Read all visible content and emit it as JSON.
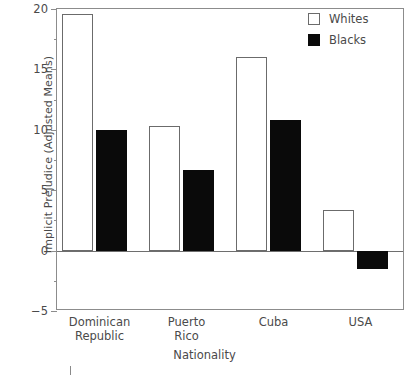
{
  "chart_data": {
    "type": "bar",
    "title": "",
    "subtitle": "",
    "xlabel": "Nationality",
    "ylabel": "Implicit Prejudice (Adjusted Means)",
    "categories": [
      "Dominican Republic",
      "Puerto Rico",
      "Cuba",
      "USA"
    ],
    "category_lines": [
      [
        "Dominican",
        "Republic"
      ],
      [
        "Puerto",
        "Rico"
      ],
      [
        "Cuba"
      ],
      [
        "USA"
      ]
    ],
    "series": [
      {
        "name": "Whites",
        "color": "#ffffff",
        "edge_color": "#6b6b6b",
        "values": [
          19.6,
          10.3,
          16.0,
          3.4
        ]
      },
      {
        "name": "Blacks",
        "color": "#0a0a0a",
        "edge_color": "#0a0a0a",
        "values": [
          10.0,
          6.7,
          10.8,
          -1.5
        ]
      }
    ],
    "ylim": [
      -5,
      20
    ],
    "ytick_labels": [
      "20",
      "15",
      "10",
      "5",
      "0",
      "−5"
    ],
    "ytick_values": [
      20,
      15,
      10,
      5,
      0,
      -5
    ],
    "yminor_values": [
      17.5,
      12.5,
      7.5,
      2.5,
      -2.5
    ],
    "grid": false,
    "legend_position": "top-right",
    "zero_line": 0
  },
  "legend": {
    "entries": [
      {
        "label": "Whites",
        "swatch": "white-square"
      },
      {
        "label": "Blacks",
        "swatch": "black-square"
      }
    ]
  },
  "axes": {
    "y_title": "Implicit Prejudice (Adjusted Means)",
    "x_title": "Nationality"
  }
}
